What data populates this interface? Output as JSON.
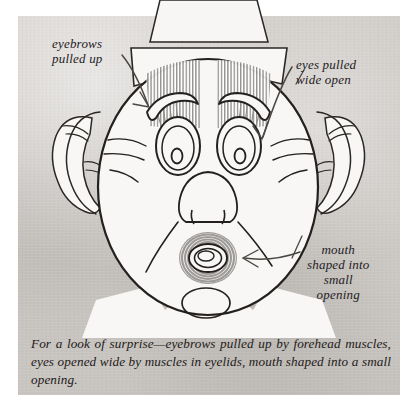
{
  "figure": {
    "kind": "pen-and-ink anatomical face illustration",
    "background_color": "#cac6c2",
    "ink_color": "#23201e",
    "muscle_shading_color": "#8d8a88",
    "paper_color": "#f6f5f3"
  },
  "labels": {
    "eyebrows": "eyebrows\npulled up",
    "eyes": "eyes pulled\nwide open",
    "mouth": "mouth\nshaped into\nsmall\nopening"
  },
  "annotations": [
    {
      "name": "arrow-to-eyebrow",
      "label_key": "eyebrows",
      "points_to": "left eyebrow"
    },
    {
      "name": "arrow-to-eye",
      "label_key": "eyes",
      "points_to": "right eye"
    },
    {
      "name": "arrow-to-mouth",
      "label_key": "mouth",
      "points_to": "mouth opening"
    }
  ],
  "caption": {
    "text": "For a look of surprise—eyebrows pulled up by forehead muscles, eyes opened wide by muscles in eyelids, mouth shaped into a small opening."
  },
  "face_parts": [
    "hat",
    "forehead-muscles",
    "left-eyebrow",
    "right-eyebrow",
    "left-eye",
    "right-eye",
    "left-ear",
    "right-ear",
    "nose",
    "mouth",
    "chin",
    "collar"
  ]
}
